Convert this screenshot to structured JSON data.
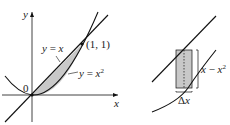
{
  "left_panel": {
    "axis_x_label": "x",
    "axis_y_label": "y",
    "origin_label": "0",
    "point_label": "(1, 1)",
    "line_label_lhs": "y",
    "line_label_eq": " = ",
    "line_label_rhs": "x",
    "parabola_label_lhs": "y",
    "parabola_label_eq": " = ",
    "parabola_label_rhs": "x",
    "parabola_label_exp": "2"
  },
  "right_panel": {
    "height_label_a": "x",
    "height_label_op": " − ",
    "height_label_b": "x",
    "height_label_exp": "2",
    "width_label_delta": "Δ",
    "width_label_x": "x"
  },
  "colors": {
    "stroke": "#111111",
    "shade": "#c8c8c8",
    "background": "#ffffff"
  }
}
